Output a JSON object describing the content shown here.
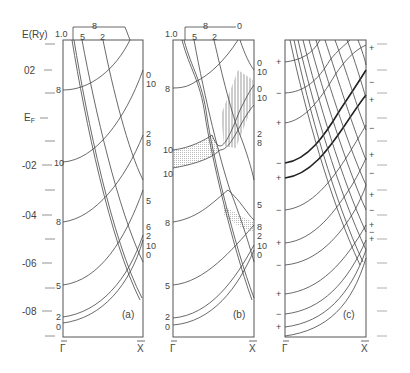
{
  "figure": {
    "y_axis_title": "E(Ry)",
    "fermi_label": "E",
    "fermi_sub": "F",
    "y_ticks": [
      {
        "label": "02",
        "y": 70
      },
      {
        "label": "-02",
        "y": 165
      },
      {
        "label": "-04",
        "y": 215
      },
      {
        "label": "-06",
        "y": 263
      },
      {
        "label": "-08",
        "y": 311
      }
    ],
    "x_start_label": "Γ",
    "x_end_label": "X",
    "panels": [
      {
        "id": "a",
        "caption": "(a)",
        "top_labels": [
          "1.0",
          "5",
          "2",
          "8"
        ],
        "left_labels": [
          "8",
          "10",
          "8",
          "5",
          "2",
          "0"
        ],
        "right_labels": [
          "0",
          "10",
          "2",
          "8",
          "5",
          "6",
          "2",
          "10",
          "0"
        ]
      },
      {
        "id": "b",
        "caption": "(b)",
        "top_labels": [
          "1.0",
          "5",
          "2",
          "8",
          "0"
        ],
        "left_labels": [
          "8",
          "10",
          "10",
          "8",
          "5",
          "2",
          "0"
        ],
        "right_labels": [
          "0",
          "10",
          "0",
          "10",
          "2",
          "8",
          "5",
          "8",
          "2",
          "10",
          "0"
        ]
      },
      {
        "id": "c",
        "caption": "(c)",
        "left_parity": [
          "+",
          "−",
          "+",
          "−",
          "+",
          "−",
          "+",
          "−",
          "+",
          "−",
          "+",
          "−",
          "+"
        ],
        "right_parity": [
          "+",
          "−",
          "+",
          "−",
          "+",
          "−",
          "+",
          "−",
          "+",
          "−",
          "+"
        ]
      }
    ]
  }
}
